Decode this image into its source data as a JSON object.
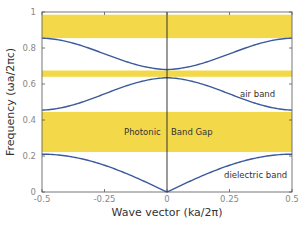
{
  "chart_data": {
    "type": "line",
    "title": "",
    "xlabel": "Wave vector (ka/2π)",
    "ylabel": "Frequency (ωa/2πc)",
    "xlim": [
      -0.5,
      0.5
    ],
    "ylim": [
      0,
      1
    ],
    "xticks": [
      -0.5,
      -0.25,
      0,
      0.25,
      0.5
    ],
    "xtick_labels": [
      "-0.5",
      "-0.25",
      "0",
      "0.25",
      "0.5"
    ],
    "yticks": [
      0,
      0.2,
      0.4,
      0.6,
      0.8,
      1
    ],
    "ytick_labels": [
      "0",
      "0.2",
      "0.4",
      "0.6",
      "0.8",
      "1"
    ],
    "grid": false,
    "gaps": [
      {
        "name": "upper gap",
        "from": 0.855,
        "to": 0.985
      },
      {
        "name": "narrow gap",
        "from": 0.64,
        "to": 0.675
      },
      {
        "name": "photonic band gap",
        "from": 0.222,
        "to": 0.445
      }
    ],
    "series": [
      {
        "name": "dielectric band",
        "k_edge": 0.5,
        "f_center": 0.0,
        "f_edge": 0.21
      },
      {
        "name": "air band",
        "k_edge": 0.5,
        "f_center": 0.635,
        "f_edge": 0.455
      },
      {
        "name": "third band",
        "k_edge": 0.5,
        "f_center": 0.68,
        "f_edge": 0.855
      }
    ],
    "annotations": [
      {
        "text": "air band",
        "x": 0.37,
        "y": 0.53
      },
      {
        "text": "Photonic",
        "x": -0.12,
        "y": 0.33
      },
      {
        "text": "Band Gap",
        "x": 0.1,
        "y": 0.33
      },
      {
        "text": "dielectric band",
        "x": 0.33,
        "y": 0.1
      }
    ],
    "colors": {
      "gap": "#f3d94a",
      "line": "#3a5a9c",
      "axis": "#555555"
    }
  }
}
